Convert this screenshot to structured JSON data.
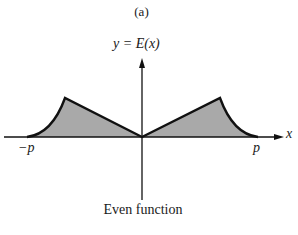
{
  "figure": {
    "panel_label": "(a)",
    "y_axis_label": "y = E(x)",
    "x_axis_label": "x",
    "tick_labels": {
      "left": "−p",
      "right": "p"
    },
    "caption": "Even function"
  },
  "colors": {
    "fill": "#a9a9a9",
    "stroke": "#111111",
    "background": "#ffffff"
  },
  "shape": {
    "description": "Shaded even function symmetric about the y-axis, zero at x=0 and at ±p, peaking midway on each side with a concave tail toward ±p",
    "points": {
      "left_end": [
        27,
        137
      ],
      "left_peak": [
        65,
        98
      ],
      "origin": [
        142,
        137
      ],
      "right_peak": [
        220,
        98
      ],
      "right_end": [
        258,
        137
      ]
    }
  }
}
